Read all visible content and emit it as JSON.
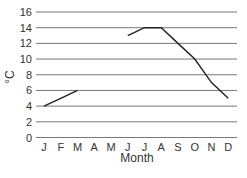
{
  "chart_data": {
    "type": "line",
    "title": "",
    "xlabel": "Month",
    "ylabel": "°C",
    "categories": [
      "J",
      "F",
      "M",
      "A",
      "M",
      "J",
      "J",
      "A",
      "S",
      "O",
      "N",
      "D"
    ],
    "series": [
      {
        "name": "Temperature",
        "values": [
          4,
          5,
          6,
          null,
          null,
          13,
          14,
          14,
          12,
          10,
          7,
          5
        ]
      }
    ],
    "ylim": [
      0,
      16
    ],
    "yticks": [
      0,
      2,
      4,
      6,
      8,
      10,
      12,
      14,
      16
    ],
    "grid": true,
    "legend": null,
    "colors": {
      "line": "#222222",
      "grid": "#777777",
      "text": "#333333"
    }
  }
}
